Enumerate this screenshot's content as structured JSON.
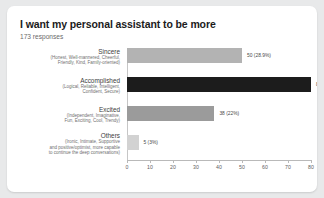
{
  "card": {
    "title": "I want my personal assistant to be more",
    "responses": "173 responses"
  },
  "chart_data": {
    "type": "bar",
    "orientation": "horizontal",
    "title": "I want my personal assistant to be more",
    "subtitle": "173 responses",
    "xlabel": "",
    "ylabel": "",
    "xlim": [
      0,
      80
    ],
    "xticks": [
      "0",
      "10",
      "20",
      "30",
      "40",
      "50",
      "60",
      "70",
      "80"
    ],
    "grid": false,
    "legend": "none",
    "total_responses": 173,
    "categories": [
      "Sincere (Honest, Well-mannered, Cheerful, Friendly, Kind, Family-oriented)",
      "Accomplished (Logical, Reliable, Intelligent, Confident, Secure)",
      "Excited (Independent, Imaginative, Fun, Exciting, Cool, Trendy)",
      "Others (Ironic, Intimate, Supportive and positive/optimist, more capable to continue the deep conversations)"
    ],
    "values": [
      50,
      80,
      38,
      5
    ],
    "percentages": [
      28.9,
      46.2,
      22.0,
      3.0
    ],
    "bars": [
      {
        "name": "Sincere",
        "description_lines": [
          "(Honest, Well-mannered, Cheerful,",
          "Friendly, Kind, Family-oriented)"
        ],
        "value": 50,
        "percent": 28.9,
        "value_label": "50 (28.9%)",
        "color": "#b3b3b3"
      },
      {
        "name": "Accomplished",
        "description_lines": [
          "(Logical, Reliable, Intelligent,",
          "Confident, Secure)"
        ],
        "value": 80,
        "percent": 46.2,
        "value_label": "80 (46.2%)",
        "color": "#1c1c1c"
      },
      {
        "name": "Excited",
        "description_lines": [
          "(Independent, Imaginative,",
          "Fun, Exciting, Cool, Trendy)"
        ],
        "value": 38,
        "percent": 22.0,
        "value_label": "38 (22%)",
        "color": "#9b9b9b"
      },
      {
        "name": "Others",
        "description_lines": [
          "(Ironic, Intimate, Supportive",
          "and positive/optimist, more capable",
          "to continue the deep conversations)"
        ],
        "value": 5,
        "percent": 3.0,
        "value_label": "5 (3%)",
        "color": "#d2d2d2"
      }
    ]
  }
}
